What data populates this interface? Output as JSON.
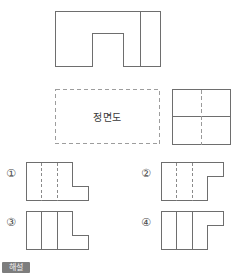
{
  "page": {
    "language": "ko",
    "kind": "orthographic-projection-multiple-choice",
    "background_color": "#ffffff",
    "line_color": "#6e6e6e",
    "hidden_line_color": "#8a8a8a"
  },
  "given_views": {
    "top_view": {
      "name": "top-view-figure",
      "description": "rectangle with rectangular notch cut from bottom edge and one vertical division line on right",
      "outline_points": "0,0 105,0 105,55 68,55 68,22 37,22 37,55 0,55",
      "internal_lines": [
        {
          "kind": "solid",
          "x1": 85,
          "y1": 0,
          "x2": 85,
          "y2": 55
        }
      ]
    },
    "front_view_placeholder": {
      "name": "front-view-placeholder",
      "label": "정면도",
      "style": "dashed-rectangle"
    },
    "side_view": {
      "name": "side-view-figure",
      "description": "rectangle divided by a solid horizontal mid line with a dashed vertical center line",
      "width": 58,
      "height": 55,
      "internal_lines": [
        {
          "kind": "solid",
          "x1": 0,
          "y1": 27,
          "x2": 58,
          "y2": 27
        },
        {
          "kind": "center",
          "x1": 29,
          "y1": 0,
          "x2": 29,
          "y2": 55
        }
      ]
    }
  },
  "choices": [
    {
      "marker": "①",
      "name": "choice-1",
      "outline_points": "0,0 46,0 46,24 62,24 62,38 0,38",
      "internal_lines": [
        {
          "kind": "hidden",
          "x1": 15,
          "y1": 0,
          "x2": 15,
          "y2": 38
        },
        {
          "kind": "hidden",
          "x1": 31,
          "y1": 0,
          "x2": 31,
          "y2": 38
        },
        {
          "kind": "solid",
          "x1": 46,
          "y1": 0,
          "x2": 46,
          "y2": 24
        }
      ]
    },
    {
      "marker": "②",
      "name": "choice-2",
      "outline_points": "0,0 62,0 62,14 46,14 46,38 0,38",
      "internal_lines": [
        {
          "kind": "hidden",
          "x1": 15,
          "y1": 0,
          "x2": 15,
          "y2": 38
        },
        {
          "kind": "hidden",
          "x1": 31,
          "y1": 0,
          "x2": 31,
          "y2": 38
        },
        {
          "kind": "solid",
          "x1": 46,
          "y1": 14,
          "x2": 46,
          "y2": 38
        }
      ]
    },
    {
      "marker": "③",
      "name": "choice-3",
      "outline_points": "0,0 46,0 46,24 62,24 62,38 0,38",
      "internal_lines": [
        {
          "kind": "solid",
          "x1": 15,
          "y1": 0,
          "x2": 15,
          "y2": 38
        },
        {
          "kind": "solid",
          "x1": 31,
          "y1": 0,
          "x2": 31,
          "y2": 38
        },
        {
          "kind": "solid",
          "x1": 46,
          "y1": 0,
          "x2": 46,
          "y2": 24
        }
      ]
    },
    {
      "marker": "④",
      "name": "choice-4",
      "outline_points": "0,0 62,0 62,14 46,14 46,38 0,38",
      "internal_lines": [
        {
          "kind": "solid",
          "x1": 15,
          "y1": 0,
          "x2": 15,
          "y2": 38
        },
        {
          "kind": "solid",
          "x1": 31,
          "y1": 0,
          "x2": 31,
          "y2": 38
        },
        {
          "kind": "solid",
          "x1": 46,
          "y1": 14,
          "x2": 46,
          "y2": 38
        }
      ]
    }
  ],
  "footer": {
    "tag_label": "해설",
    "tag_background": "#7d7d7d",
    "tag_text_color": "#f0f0f0"
  }
}
